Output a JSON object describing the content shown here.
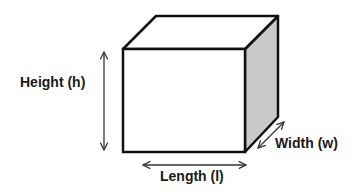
{
  "diagram": {
    "type": "rectangular-prism",
    "colors": {
      "stroke": "#111111",
      "front_face": "#ffffff",
      "top_face": "#ffffff",
      "side_face": "#c9c9c9",
      "arrow": "#333333",
      "label": "#1a1a1a"
    },
    "labels": {
      "height": "Height (h)",
      "length": "Length (l)",
      "width": "Width (w)"
    }
  }
}
